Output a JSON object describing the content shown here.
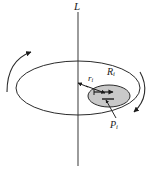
{
  "figure": {
    "type": "physics-diagram",
    "background_color": "#ffffff",
    "stroke_color": "#1a1a1a",
    "disk_fill_color": "#cccccc",
    "labels": {
      "axis": {
        "text": "L",
        "name": "axis-label"
      },
      "radius_to_particle": {
        "base": "r",
        "subscript": "i",
        "name": "distance-label"
      },
      "particle_radius": {
        "base": "R",
        "subscript": "i",
        "name": "radius-label"
      },
      "particle": {
        "base": "P",
        "subscript": "i",
        "name": "particle-label"
      }
    },
    "elements": {
      "vertical_axis": "vertical line L through center of platter",
      "platter": "large ellipse (perspective circle)",
      "particle_disk": "small shaded ellipse on the platter, right of center",
      "left_rotation_arrow": "curved arrow on left pointing up-right",
      "right_rotation_arrow": "curved arrow on right pointing down-left",
      "r_arrow": "arrow from axis center toward particle disk",
      "R_arrow": "arrow from left edge of particle disk to its center",
      "P_leader": "leader line from P label up-left to particle disk"
    }
  }
}
